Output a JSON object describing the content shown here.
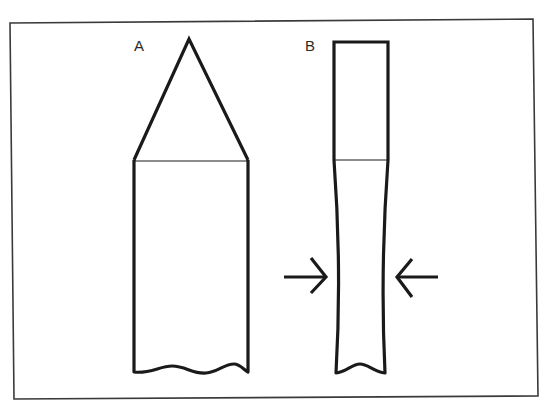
{
  "figure": {
    "labels": {
      "a": "A",
      "b": "B"
    },
    "colors": {
      "stroke": "#1a1a1a",
      "frame": "#3a3a3a",
      "background": "#ffffff"
    },
    "shapes": [
      {
        "id": "A",
        "description": "Pointed shaft: triangular tip above rectangular body with wavy cut bottom"
      },
      {
        "id": "B",
        "description": "Flat-topped shaft narrowing (waisted) below the joint, with compression arrows from both sides"
      }
    ],
    "arrows": [
      {
        "direction": "right",
        "side": "left"
      },
      {
        "direction": "left",
        "side": "right"
      }
    ]
  }
}
